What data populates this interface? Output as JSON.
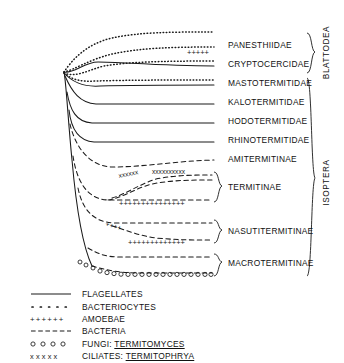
{
  "figure": {
    "kind": "phylogenetic-tree-with-symbiont-lineages",
    "background_color": "#ffffff",
    "line_color": "#1a1a1a"
  },
  "taxa": [
    {
      "id": "panesthiidae",
      "label": "PANESTHIIDAE",
      "label_x": 228,
      "label_y": 41,
      "tip_y": 47,
      "clade": "blattodea"
    },
    {
      "id": "cryptocercidae",
      "label": "CRYPTOCERCIDAE",
      "label_x": 228,
      "label_y": 60,
      "tip_y": 66,
      "clade": "blattodea"
    },
    {
      "id": "mastotermitidae",
      "label": "MASTOTERMITIDAE",
      "label_x": 228,
      "label_y": 79,
      "tip_y": 85,
      "clade": "isoptera"
    },
    {
      "id": "kalotermitidae",
      "label": "KALOTERMITIDAE",
      "label_x": 228,
      "label_y": 98,
      "tip_y": 104,
      "clade": "isoptera"
    },
    {
      "id": "hodotermitidae",
      "label": "HODOTERMITIDAE",
      "label_x": 228,
      "label_y": 117,
      "tip_y": 123,
      "clade": "isoptera"
    },
    {
      "id": "rhinotermitidae",
      "label": "RHINOTERMITIDAE",
      "label_x": 228,
      "label_y": 136,
      "tip_y": 142,
      "clade": "isoptera"
    },
    {
      "id": "amitermitinae",
      "label": "AMITERMITINAE",
      "label_x": 228,
      "label_y": 155,
      "tip_y": 161,
      "clade": "isoptera"
    },
    {
      "id": "termitinae",
      "label": "TERMITINAE",
      "label_x": 240,
      "label_y": 188,
      "tip_y": 193,
      "clade": "isoptera"
    },
    {
      "id": "nasutitermitinae",
      "label": "NASUTITERMITINAE",
      "label_x": 240,
      "label_y": 232,
      "tip_y": 236,
      "clade": "isoptera"
    },
    {
      "id": "macrotermitinae",
      "label": "MACROTERMITINAE",
      "label_x": 240,
      "label_y": 265,
      "tip_y": 269,
      "clade": "isoptera"
    }
  ],
  "clades": [
    {
      "id": "blattodea",
      "label": "BLATTODEA",
      "label_x": 324,
      "label_y": 48,
      "bracket_top": 34,
      "bracket_bottom": 76
    },
    {
      "id": "isoptera",
      "label": "ISOPTERA",
      "label_x": 324,
      "label_y": 178,
      "bracket_top": 78,
      "bracket_bottom": 276
    }
  ],
  "legend": {
    "rows": [
      {
        "id": "flagellates",
        "symbol": "solid-line",
        "text": "FLAGELLATES",
        "italic_name": "",
        "underline": false
      },
      {
        "id": "bacteriocytes",
        "symbol": "dotted-line",
        "text": "BACTERIOCYTES",
        "italic_name": "",
        "underline": false
      },
      {
        "id": "amoebae",
        "symbol": "plus-line",
        "text": "AMOEBAE",
        "italic_name": "",
        "underline": false
      },
      {
        "id": "bacteria",
        "symbol": "dashed-line",
        "text": "BACTERIA",
        "italic_name": "",
        "underline": false
      },
      {
        "id": "fungi",
        "symbol": "circle-line",
        "text": "FUNGI: ",
        "italic_name": "TERMITOMYCES",
        "underline": true
      },
      {
        "id": "ciliates",
        "symbol": "x-line",
        "text": "CILIATES: ",
        "italic_name": "TERMITOPHRYA",
        "underline": true
      }
    ]
  },
  "symbol_key": {
    "solid-line": "FLAGELLATES",
    "dotted-line": "BACTERIOCYTES",
    "plus-line": "AMOEBAE",
    "dashed-line": "BACTERIA",
    "circle-line": "FUNGI: TERMITOMYCES",
    "x-line": "CILIATES: TERMITOPHRYA"
  }
}
